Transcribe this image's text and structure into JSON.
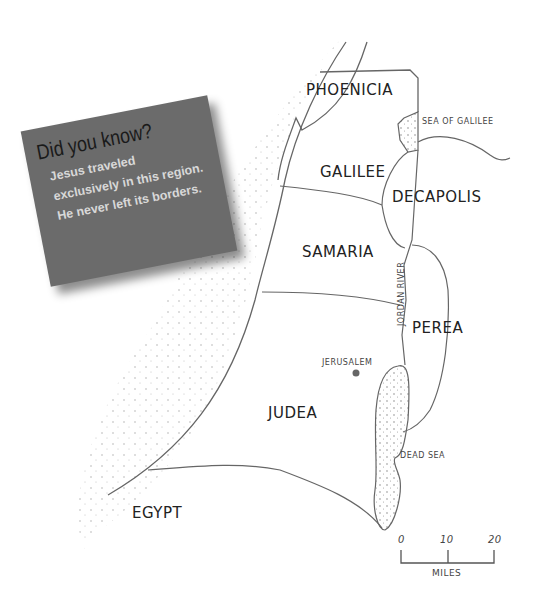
{
  "callout": {
    "title": "Did you know?",
    "body": "Jesus traveled exclusively in this region. He never left its borders.",
    "background_color": "#6b6b6b"
  },
  "regions": {
    "phoenicia": "PHOENICIA",
    "galilee": "GALILEE",
    "decapolis": "DECAPOLIS",
    "samaria": "SAMARIA",
    "perea": "PEREA",
    "judea": "JUDEA",
    "egypt": "EGYPT"
  },
  "features": {
    "sea_of_galilee": "SEA OF GALILEE",
    "jordan_river": "JORDAN RIVER",
    "dead_sea": "DEAD SEA",
    "jerusalem": "JERUSALEM"
  },
  "scale": {
    "ticks": [
      "0",
      "10",
      "20"
    ],
    "unit": "MILES"
  }
}
